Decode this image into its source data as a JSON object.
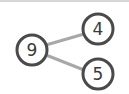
{
  "diagram": {
    "type": "number-bond",
    "whole": {
      "value": "9"
    },
    "parts": [
      {
        "value": "4"
      },
      {
        "value": "5"
      }
    ],
    "colors": {
      "circle_stroke": "#4a4a4a",
      "connector": "#a8a8a8",
      "text": "#3a3a3a"
    }
  }
}
